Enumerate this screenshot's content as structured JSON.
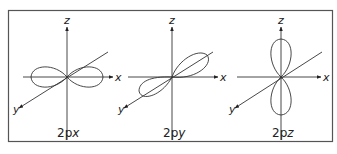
{
  "figure": {
    "panels": [
      {
        "id": "px",
        "caption_main": "2p",
        "caption_sub": "x",
        "axis_labels": {
          "z": "z",
          "x": "x",
          "y": "y"
        },
        "lobe_axis": "x"
      },
      {
        "id": "py",
        "caption_main": "2p",
        "caption_sub": "y",
        "axis_labels": {
          "z": "z",
          "x": "x",
          "y": "y",
          "x_left": "x"
        },
        "lobe_axis": "y"
      },
      {
        "id": "pz",
        "caption_main": "2p",
        "caption_sub": "z",
        "axis_labels": {
          "z": "z",
          "x": "x",
          "y": "y",
          "x_left": "x"
        },
        "lobe_axis": "z"
      }
    ],
    "colors": {
      "line": "#333333",
      "border": "#555555",
      "background": "#ffffff"
    }
  }
}
